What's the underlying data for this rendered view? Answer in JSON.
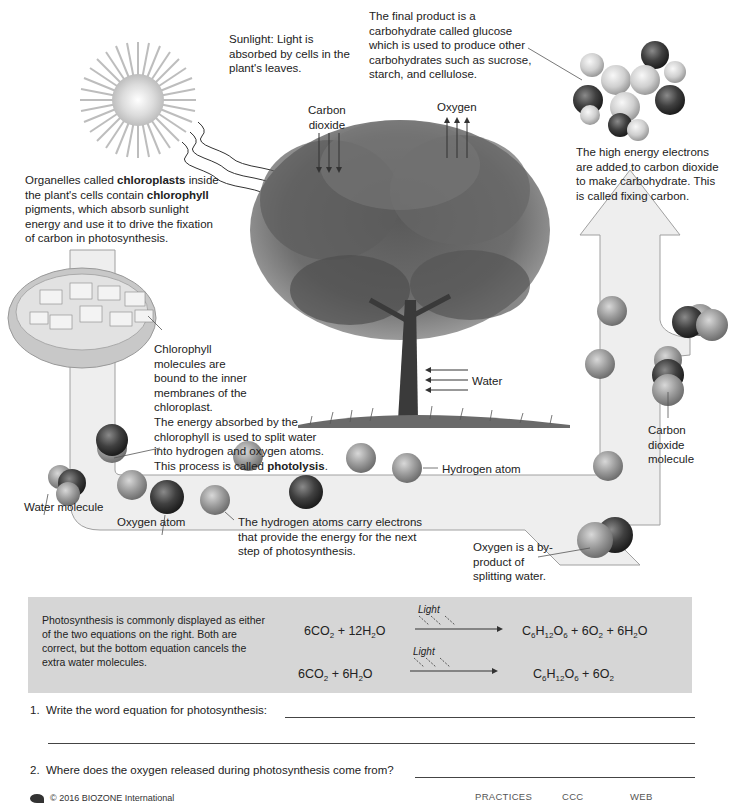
{
  "diagram": {
    "sunlight_label": "Sunlight: Light is absorbed by cells in the plant's leaves.",
    "carbon_dioxide_label": [
      "Carbon",
      "dioxide"
    ],
    "oxygen_label": "Oxygen",
    "glucose_label": "The final product is a carbohydrate called glucose which is used to produce other carbohydrates such as sucrose, starch, and cellulose.",
    "fixing_carbon_label": "The high energy electrons are added to carbon dioxide to make carbohydrate. This is called fixing carbon.",
    "chloroplast_label": {
      "pre": "Organelles called ",
      "bold1": "chloroplasts",
      "mid": " inside the plant's cells contain ",
      "bold2": "chlorophyll",
      "post": " pigments, which absorb sunlight energy and use it to drive the fixation of carbon in photosynthesis."
    },
    "chlorophyll_label": "Chlorophyll molecules are bound to the inner membranes of the chloroplast.",
    "water_label": "Water",
    "photolysis_label": {
      "pre": "The energy absorbed by the chlorophyll is used to split water into hydrogen and oxygen atoms. This process is called ",
      "bold": "photolysis",
      "post": "."
    },
    "carbon_dioxide_molecule_label": [
      "Carbon",
      "dioxide",
      "molecule"
    ],
    "hydrogen_atom_label": "Hydrogen atom",
    "water_molecule_label": "Water molecule",
    "oxygen_atom_label": "Oxygen atom",
    "hydrogen_carry_label": "The hydrogen atoms carry electrons that provide the energy for the next step of photosynthesis.",
    "oxygen_byproduct_label": "Oxygen is a by-product of splitting water.",
    "colors": {
      "arrow_fill": "#eeeeee",
      "arrow_stroke": "#9a9a9a",
      "hydrogen": "#9a9a9a",
      "oxygen": "#444444",
      "tree": "#4a4a4a"
    }
  },
  "equations": {
    "description": "Photosynthesis is commonly displayed as either of the two equations on the right. Both are correct, but the bottom equation cancels the extra water molecules.",
    "light_label": "Light",
    "eq1": {
      "reactants": "6CO₂ + 12H₂O",
      "products": "C₆H₁₂O₆ + 6O₂ + 6H₂O"
    },
    "eq2": {
      "reactants": "6CO₂ + 6H₂O",
      "products": "C₆H₁₂O₆ + 6O₂"
    }
  },
  "questions": [
    {
      "number": "1.",
      "text": "Write the word equation for photosynthesis:"
    },
    {
      "number": "2.",
      "text": "Where does the oxygen released during photosynthesis come from?"
    }
  ],
  "footer": {
    "copyright": "© 2016 BIOZONE International",
    "tags": [
      "PRACTICES",
      "CCC",
      "WEB"
    ]
  }
}
